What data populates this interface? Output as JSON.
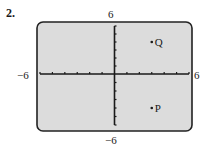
{
  "problem": {
    "number": "2."
  },
  "axes": {
    "x_min_label": "−6",
    "x_max_label": "6",
    "y_max_label": "6",
    "y_min_label": "−6"
  },
  "colors": {
    "panel_fill": "#dcdcdc",
    "panel_border": "#222222",
    "axis": "#1a1a1a",
    "point": "#1a1a1a"
  },
  "chart_data": {
    "type": "scatter",
    "title": "",
    "xlabel": "",
    "ylabel": "",
    "xlim": [
      -6,
      6
    ],
    "ylim": [
      -6,
      6
    ],
    "xticks": [
      -6,
      -5,
      -4,
      -3,
      -2,
      -1,
      0,
      1,
      2,
      3,
      4,
      5,
      6
    ],
    "yticks": [
      -6,
      -5,
      -4,
      -3,
      -2,
      -1,
      0,
      1,
      2,
      3,
      4,
      5,
      6
    ],
    "tick_labels": {
      "x": [
        "−6",
        "6"
      ],
      "y": [
        "−6",
        "6"
      ]
    },
    "grid": false,
    "legend": null,
    "points": [
      {
        "label": "Q",
        "x": 3,
        "y": 4
      },
      {
        "label": "P",
        "x": 3,
        "y": -4
      }
    ]
  }
}
